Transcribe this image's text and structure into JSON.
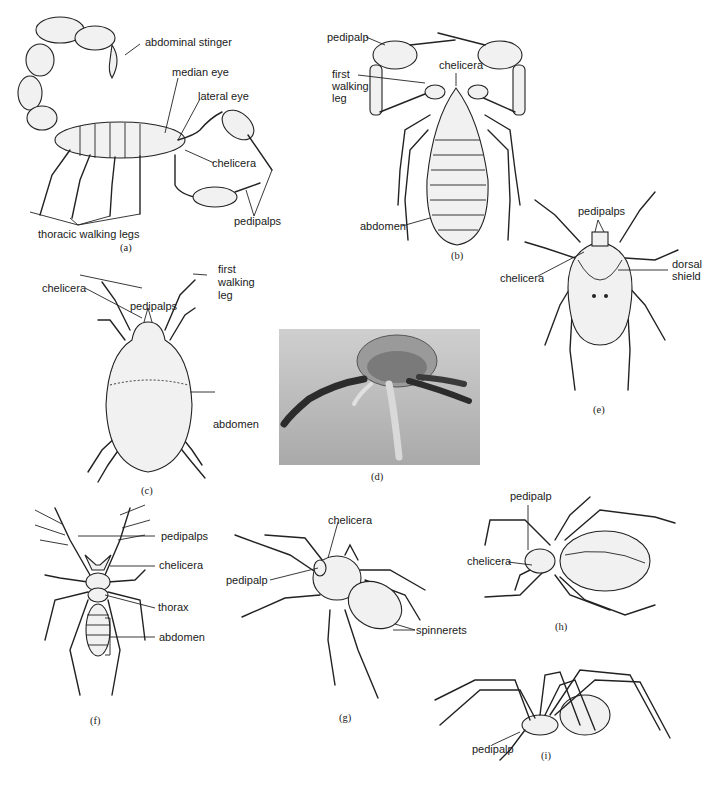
{
  "figure": {
    "panels": [
      {
        "id": "a",
        "caption": "(a)",
        "subject": "scorpion",
        "labels": [
          "abdominal stinger",
          "median eye",
          "lateral eye",
          "chelicera",
          "pedipalps",
          "thoracic walking legs"
        ]
      },
      {
        "id": "b",
        "caption": "(b)",
        "subject": "pseudoscorpion",
        "labels": [
          "pedipalp",
          "first walking leg",
          "chelicera",
          "abdomen"
        ]
      },
      {
        "id": "c",
        "caption": "(c)",
        "subject": "mite",
        "labels": [
          "pedipalps",
          "chelicera",
          "first walking leg",
          "abdomen"
        ]
      },
      {
        "id": "d",
        "caption": "(d)",
        "subject": "tick micrograph",
        "labels": []
      },
      {
        "id": "e",
        "caption": "(e)",
        "subject": "tick",
        "labels": [
          "pedipalps",
          "chelicera",
          "dorsal shield"
        ]
      },
      {
        "id": "f",
        "caption": "(f)",
        "subject": "solifugid",
        "labels": [
          "pedipalps",
          "chelicera",
          "thorax",
          "abdomen"
        ]
      },
      {
        "id": "g",
        "caption": "(g)",
        "subject": "hairy spider",
        "labels": [
          "chelicera",
          "pedipalp",
          "spinnerets"
        ]
      },
      {
        "id": "h",
        "caption": "(h)",
        "subject": "orb spider",
        "labels": [
          "pedipalp",
          "chelicera"
        ]
      },
      {
        "id": "i",
        "caption": "(i)",
        "subject": "long-legged spider",
        "labels": [
          "pedipalp"
        ]
      }
    ]
  },
  "a": {
    "caption": "(a)",
    "stinger": "abdominal stinger",
    "median_eye": "median eye",
    "lateral_eye": "lateral eye",
    "chelicera": "chelicera",
    "pedipalps": "pedipalps",
    "legs": "thoracic walking legs"
  },
  "b": {
    "caption": "(b)",
    "pedipalp": "pedipalp",
    "first": "first",
    "walking": "walking",
    "leg": "leg",
    "chelicera": "chelicera",
    "abdomen": "abdomen"
  },
  "c": {
    "caption": "(c)",
    "pedipalps": "pedipalps",
    "chelicera": "chelicera",
    "first": "first",
    "walking": "walking",
    "leg": "leg",
    "abdomen": "abdomen"
  },
  "d": {
    "caption": "(d)"
  },
  "e": {
    "caption": "(e)",
    "pedipalps": "pedipalps",
    "chelicera": "chelicera",
    "dorsal": "dorsal",
    "shield": "shield"
  },
  "f": {
    "caption": "(f)",
    "pedipalps": "pedipalps",
    "chelicera": "chelicera",
    "thorax": "thorax",
    "abdomen": "abdomen"
  },
  "g": {
    "caption": "(g)",
    "chelicera": "chelicera",
    "pedipalp": "pedipalp",
    "spinnerets": "spinnerets"
  },
  "h": {
    "caption": "(h)",
    "pedipalp": "pedipalp",
    "chelicera": "chelicera"
  },
  "i": {
    "caption": "(i)",
    "pedipalp": "pedipalp"
  }
}
